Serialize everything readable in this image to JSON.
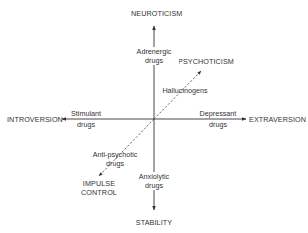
{
  "axes": {
    "top": "NEUROTICISM",
    "bottom": "STABILITY",
    "left": "INTROVERSION",
    "right": "EXTRAVERSION",
    "diagonal_up": "PSYCHOTICISM",
    "diagonal_down": [
      "IMPULSE",
      "CONTROL"
    ]
  },
  "drugs": {
    "adrenergic": [
      "Adrenergic",
      "drugs"
    ],
    "hallucinogens": "Hallucinogens",
    "stimulant": [
      "Stimulant",
      "drugs"
    ],
    "depressant": [
      "Depressant",
      "drugs"
    ],
    "anti_psychotic": [
      "Anti-psychotic",
      "drugs"
    ],
    "anxiolytic": [
      "Anxiolytic",
      "drugs"
    ]
  },
  "colors": {
    "line": "#333333",
    "text": "#2a2a2a",
    "background": "#ffffff"
  }
}
